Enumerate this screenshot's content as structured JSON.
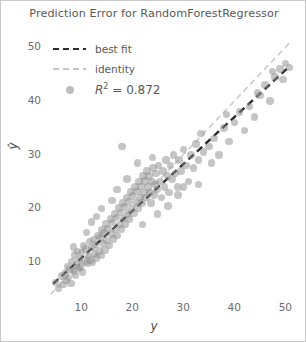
{
  "chart_data": {
    "type": "scatter",
    "title": "Prediction Error for RandomForestRegressor",
    "xlabel": "y",
    "ylabel": "ŷ",
    "xlim": [
      3.5,
      51.5
    ],
    "ylim": [
      3.5,
      52.5
    ],
    "xticks": [
      10,
      20,
      30,
      40,
      50
    ],
    "yticks": [
      10,
      20,
      30,
      40,
      50
    ],
    "grid": false,
    "legend_position": "upper left",
    "legend": [
      {
        "key": "best-fit",
        "label": "best fit",
        "style": "dashed",
        "color": "#2b2b2b"
      },
      {
        "key": "identity",
        "label": "identity",
        "style": "dashed",
        "color": "#c6c6c6"
      },
      {
        "key": "r2",
        "label": "R² = 0.872",
        "style": "marker",
        "color": "#969696"
      }
    ],
    "r_squared": 0.872,
    "identity_line": {
      "slope": 1,
      "intercept": 0,
      "x_range": [
        4,
        51
      ]
    },
    "best_fit_line": {
      "slope": 0.875,
      "intercept": 2.0,
      "x_range": [
        4.5,
        50.5
      ]
    },
    "marker": {
      "color": "#8c8c8c",
      "alpha": 0.5,
      "size": 7.5
    },
    "points": [
      [
        5.0,
        6.2
      ],
      [
        5.6,
        5.1
      ],
      [
        6.1,
        7.4
      ],
      [
        6.4,
        5.8
      ],
      [
        6.9,
        8.0
      ],
      [
        7.0,
        6.6
      ],
      [
        7.3,
        9.2
      ],
      [
        7.5,
        7.1
      ],
      [
        7.8,
        8.6
      ],
      [
        8.0,
        6.0
      ],
      [
        8.2,
        10.1
      ],
      [
        8.5,
        8.3
      ],
      [
        8.7,
        11.3
      ],
      [
        8.9,
        7.6
      ],
      [
        9.1,
        9.5
      ],
      [
        9.3,
        12.0
      ],
      [
        9.5,
        8.9
      ],
      [
        9.7,
        10.6
      ],
      [
        9.9,
        9.1
      ],
      [
        10.1,
        11.8
      ],
      [
        10.3,
        8.2
      ],
      [
        10.5,
        13.0
      ],
      [
        10.7,
        10.2
      ],
      [
        10.9,
        12.4
      ],
      [
        11.1,
        9.7
      ],
      [
        11.4,
        11.1
      ],
      [
        11.6,
        13.8
      ],
      [
        11.8,
        10.4
      ],
      [
        12.0,
        12.7
      ],
      [
        12.2,
        9.9
      ],
      [
        12.4,
        14.2
      ],
      [
        12.6,
        11.5
      ],
      [
        12.8,
        13.3
      ],
      [
        13.0,
        10.8
      ],
      [
        13.3,
        15.0
      ],
      [
        13.5,
        12.1
      ],
      [
        13.7,
        14.6
      ],
      [
        13.9,
        11.2
      ],
      [
        14.1,
        16.0
      ],
      [
        14.3,
        13.5
      ],
      [
        14.5,
        15.4
      ],
      [
        14.7,
        12.3
      ],
      [
        14.9,
        17.1
      ],
      [
        15.1,
        14.0
      ],
      [
        15.3,
        16.3
      ],
      [
        15.5,
        13.1
      ],
      [
        15.7,
        18.0
      ],
      [
        15.9,
        15.2
      ],
      [
        16.1,
        17.4
      ],
      [
        16.3,
        14.3
      ],
      [
        16.5,
        19.0
      ],
      [
        16.7,
        16.1
      ],
      [
        16.9,
        18.3
      ],
      [
        17.1,
        15.0
      ],
      [
        17.3,
        20.1
      ],
      [
        17.5,
        17.0
      ],
      [
        17.7,
        19.2
      ],
      [
        17.9,
        16.2
      ],
      [
        18.1,
        21.0
      ],
      [
        18.3,
        18.1
      ],
      [
        18.5,
        20.3
      ],
      [
        18.7,
        17.1
      ],
      [
        18.9,
        22.0
      ],
      [
        19.1,
        19.0
      ],
      [
        19.3,
        21.2
      ],
      [
        19.5,
        18.0
      ],
      [
        19.7,
        23.1
      ],
      [
        19.9,
        20.0
      ],
      [
        20.1,
        22.3
      ],
      [
        20.3,
        19.1
      ],
      [
        20.5,
        24.0
      ],
      [
        20.7,
        21.1
      ],
      [
        20.9,
        23.2
      ],
      [
        21.1,
        20.0
      ],
      [
        21.3,
        25.0
      ],
      [
        21.5,
        22.0
      ],
      [
        21.7,
        24.1
      ],
      [
        21.9,
        21.0
      ],
      [
        22.1,
        26.0
      ],
      [
        22.3,
        23.0
      ],
      [
        22.5,
        25.1
      ],
      [
        22.7,
        22.0
      ],
      [
        22.9,
        27.0
      ],
      [
        23.1,
        24.0
      ],
      [
        23.3,
        26.0
      ],
      [
        23.5,
        23.0
      ],
      [
        23.7,
        21.0
      ],
      [
        23.9,
        25.0
      ],
      [
        24.1,
        27.5
      ],
      [
        24.3,
        22.5
      ],
      [
        24.5,
        24.5
      ],
      [
        24.7,
        26.5
      ],
      [
        24.9,
        23.5
      ],
      [
        25.1,
        28.0
      ],
      [
        25.4,
        25.0
      ],
      [
        25.7,
        22.0
      ],
      [
        26.0,
        27.0
      ],
      [
        26.3,
        24.0
      ],
      [
        26.6,
        29.0
      ],
      [
        26.9,
        26.0
      ],
      [
        27.2,
        23.0
      ],
      [
        27.5,
        28.0
      ],
      [
        27.8,
        25.5
      ],
      [
        28.1,
        30.0
      ],
      [
        28.5,
        26.5
      ],
      [
        28.9,
        24.0
      ],
      [
        29.2,
        29.0
      ],
      [
        29.6,
        27.0
      ],
      [
        30.0,
        31.0
      ],
      [
        30.5,
        28.0
      ],
      [
        31.0,
        25.0
      ],
      [
        31.5,
        30.0
      ],
      [
        32.0,
        27.5
      ],
      [
        32.5,
        32.0
      ],
      [
        33.0,
        29.0
      ],
      [
        33.5,
        34.0
      ],
      [
        34.0,
        30.5
      ],
      [
        35.0,
        31.5
      ],
      [
        36.0,
        33.0
      ],
      [
        37.0,
        30.0
      ],
      [
        38.0,
        35.0
      ],
      [
        39.0,
        32.5
      ],
      [
        40.0,
        36.0
      ],
      [
        41.0,
        38.0
      ],
      [
        42.0,
        34.5
      ],
      [
        43.0,
        39.0
      ],
      [
        44.0,
        37.0
      ],
      [
        45.0,
        41.0
      ],
      [
        46.0,
        43.0
      ],
      [
        47.0,
        40.0
      ],
      [
        48.0,
        44.5
      ],
      [
        49.0,
        46.0
      ],
      [
        50.0,
        47.0
      ],
      [
        50.8,
        46.3
      ],
      [
        49.5,
        44.0
      ],
      [
        18.0,
        31.5
      ],
      [
        14.0,
        20.0
      ],
      [
        12.0,
        17.5
      ],
      [
        22.0,
        17.0
      ],
      [
        27.0,
        20.5
      ],
      [
        33.0,
        24.5
      ],
      [
        44.5,
        41.5
      ],
      [
        19.0,
        25.5
      ],
      [
        16.0,
        21.5
      ],
      [
        11.0,
        15.5
      ],
      [
        25.0,
        19.0
      ],
      [
        29.0,
        22.5
      ],
      [
        35.5,
        28.5
      ],
      [
        8.5,
        12.8
      ],
      [
        21.0,
        28.5
      ],
      [
        24.0,
        29.5
      ],
      [
        13.0,
        18.5
      ],
      [
        17.0,
        23.5
      ],
      [
        30.0,
        24.0
      ],
      [
        38.5,
        37.5
      ],
      [
        47.5,
        45.5
      ]
    ]
  }
}
